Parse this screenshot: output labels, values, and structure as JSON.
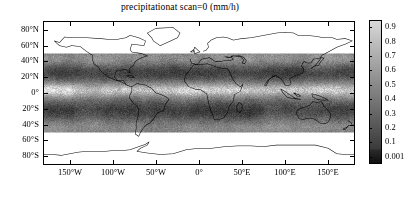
{
  "chart_data": {
    "type": "heatmap",
    "title": "precipitationat scan=0 (mm/h)",
    "xlabel": "",
    "ylabel": "",
    "grid": false,
    "projection": "cylindrical-equidistant",
    "xlim": [
      -180,
      180
    ],
    "ylim": [
      -90,
      90
    ],
    "data_latitude_range": [
      -50,
      50
    ],
    "nodata_color": "#ffffff",
    "xticks": [
      -180,
      -150,
      -100,
      -50,
      0,
      50,
      100,
      150,
      180
    ],
    "xticklabels": [
      "",
      "150°W",
      "100°W",
      "50°W",
      "0°",
      "50°E",
      "100°E",
      "150°E",
      ""
    ],
    "yticks": [
      80,
      60,
      40,
      20,
      0,
      -20,
      -40,
      -60,
      -80
    ],
    "yticklabels": [
      "80°N",
      "60°N",
      "40°N",
      "20°N",
      "0°",
      "20°S",
      "40°S",
      "60°S",
      "80°S"
    ],
    "colorbar": {
      "orientation": "vertical",
      "position": "right",
      "units": "mm/h",
      "cmap": "gray-reversed",
      "vmin": 0.001,
      "vmax": 1.0,
      "ticks": [
        0.9,
        0.8,
        0.7,
        0.6,
        0.5,
        0.4,
        0.3,
        0.2,
        0.1,
        0.001
      ],
      "ticklabels": [
        "0.9",
        "0.8",
        "0.7",
        "0.6",
        "0.5",
        "0.4",
        "0.3",
        "0.2",
        "0.1",
        "0.001"
      ]
    }
  },
  "colors": {
    "axis": "#000000",
    "background": "#ffffff",
    "coastline": "#000000",
    "cbar_high": "#d8d8d8",
    "cbar_low": "#101010"
  }
}
